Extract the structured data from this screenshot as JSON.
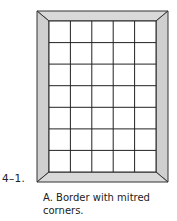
{
  "figure": {
    "number": "4–1.",
    "caption_line1": "A. Border with mitred",
    "caption_line2": "corners.",
    "grid": {
      "columns": 5,
      "rows": 7
    },
    "colors": {
      "border_fill": "#d4d4d4",
      "line": "#222222",
      "cell": "#ffffff"
    }
  }
}
